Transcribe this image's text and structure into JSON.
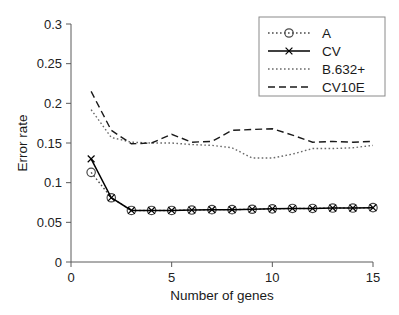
{
  "chart_data": {
    "type": "line",
    "title": "",
    "xlabel": "Number of genes",
    "ylabel": "Error rate",
    "xlim": [
      0,
      15
    ],
    "ylim": [
      0,
      0.3
    ],
    "xticks": [
      0,
      5,
      10,
      15
    ],
    "xtick_labels": [
      "0",
      "5",
      "10",
      "15"
    ],
    "yticks": [
      0,
      0.05,
      0.1,
      0.15,
      0.2,
      0.25,
      0.3
    ],
    "ytick_labels": [
      "0",
      "0.05",
      "0.1",
      "0.15",
      "0.2",
      "0.25",
      "0.3"
    ],
    "grid": false,
    "legend_position": "top-right",
    "x": [
      1,
      2,
      3,
      4,
      5,
      6,
      7,
      8,
      9,
      10,
      11,
      12,
      13,
      14,
      15
    ],
    "series": [
      {
        "name": "A",
        "style": "dotted",
        "marker": "circle",
        "color": "#4a4a4a",
        "values": [
          0.113,
          0.081,
          0.065,
          0.065,
          0.065,
          0.0655,
          0.066,
          0.066,
          0.0665,
          0.067,
          0.0675,
          0.0675,
          0.068,
          0.068,
          0.0685
        ]
      },
      {
        "name": "CV",
        "style": "solid",
        "marker": "cross",
        "color": "#000000",
        "values": [
          0.13,
          0.081,
          0.065,
          0.065,
          0.065,
          0.0655,
          0.066,
          0.066,
          0.0665,
          0.067,
          0.0675,
          0.0675,
          0.068,
          0.068,
          0.0685
        ]
      },
      {
        "name": "B.632+",
        "style": "dotted",
        "marker": "none",
        "color": "#6a6a6a",
        "values": [
          0.192,
          0.157,
          0.151,
          0.15,
          0.15,
          0.148,
          0.147,
          0.144,
          0.131,
          0.131,
          0.136,
          0.143,
          0.143,
          0.144,
          0.147
        ]
      },
      {
        "name": "CV10E",
        "style": "dashed",
        "marker": "none",
        "color": "#1a1a1a",
        "values": [
          0.215,
          0.166,
          0.149,
          0.15,
          0.161,
          0.151,
          0.152,
          0.166,
          0.167,
          0.168,
          0.16,
          0.151,
          0.152,
          0.151,
          0.152
        ]
      }
    ]
  },
  "legend": {
    "entries": [
      {
        "label": "A"
      },
      {
        "label": "CV"
      },
      {
        "label": "B.632+"
      },
      {
        "label": "CV10E"
      }
    ]
  },
  "axes": {
    "ylabel": "Error rate",
    "xlabel": "Number of genes"
  }
}
